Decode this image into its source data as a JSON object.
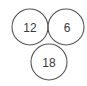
{
  "diagram": {
    "stroke_color": "#555555",
    "circles": [
      {
        "label": "12",
        "cx": 30,
        "cy": 27,
        "r": 18
      },
      {
        "label": "6",
        "cx": 66,
        "cy": 27,
        "r": 18
      },
      {
        "label": "18",
        "cx": 49,
        "cy": 62,
        "r": 18
      }
    ]
  }
}
